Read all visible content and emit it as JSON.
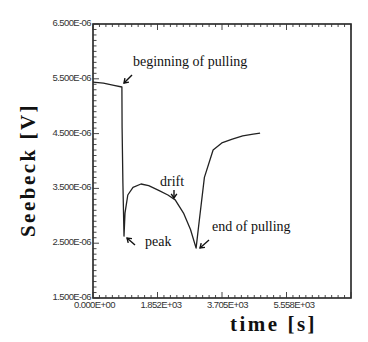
{
  "chart_data": {
    "type": "line",
    "title": "",
    "xlabel": "time [s]",
    "ylabel": "Seebeck [V]",
    "xlim": [
      0,
      7410
    ],
    "ylim": [
      1.5e-06,
      6.5e-06
    ],
    "grid": false,
    "legend": null,
    "x_ticks": [
      "0.000E+00",
      "1.852E+03",
      "3.705E+03",
      "5.558E+03"
    ],
    "y_ticks": [
      "6.500E-06",
      "5.500E-06",
      "4.500E-06",
      "3.500E-06",
      "2.500E-06",
      "1.500E-06"
    ],
    "series": [
      {
        "name": "Seebeck voltage",
        "x": [
          0,
          300,
          600,
          830,
          835,
          860,
          890,
          920,
          1000,
          1150,
          1380,
          1600,
          1900,
          2150,
          2360,
          2600,
          2800,
          2960,
          3050,
          3200,
          3450,
          3700,
          4000,
          4300,
          4600,
          4800
        ],
        "y": [
          5.44e-06,
          5.42e-06,
          5.38e-06,
          5.35e-06,
          4.6e-06,
          3.6e-06,
          2.63e-06,
          3.05e-06,
          3.38e-06,
          3.52e-06,
          3.58e-06,
          3.55e-06,
          3.46e-06,
          3.38e-06,
          3.29e-06,
          3.05e-06,
          2.75e-06,
          2.41e-06,
          2.9e-06,
          3.7e-06,
          4.2e-06,
          4.33e-06,
          4.4e-06,
          4.46e-06,
          4.49e-06,
          4.51e-06
        ]
      }
    ],
    "annotations": [
      {
        "text": "beginning of pulling",
        "x": 830,
        "y": 5.35e-06
      },
      {
        "text": "peak",
        "x": 890,
        "y": 2.63e-06
      },
      {
        "text": "drift",
        "x": 2360,
        "y": 3.29e-06
      },
      {
        "text": "end of pulling",
        "x": 2960,
        "y": 2.41e-06
      }
    ]
  },
  "axes": {
    "ylabel": "Seebeck [V]",
    "xlabel": "time [s]"
  },
  "annotations": {
    "beginning": "beginning of pulling",
    "peak": "peak",
    "drift": "drift",
    "end": "end of pulling"
  }
}
